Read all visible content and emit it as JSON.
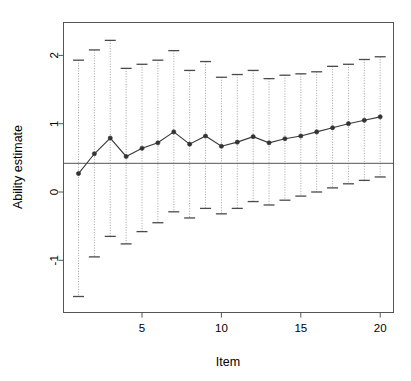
{
  "chart_data": {
    "type": "line",
    "title": "",
    "xlabel": "Item",
    "ylabel": "Ability estimate",
    "xlim": [
      0.5,
      20.5
    ],
    "ylim": [
      -1.75,
      2.45
    ],
    "grid": false,
    "legend": null,
    "xticks": [
      5,
      10,
      15,
      20
    ],
    "xtick_labels": [
      "5",
      "10",
      "15",
      "20"
    ],
    "yticks": [
      -1,
      0,
      1,
      2
    ],
    "ytick_labels": [
      "-1",
      "0",
      "1",
      "2"
    ],
    "reference_line": {
      "orientation": "horizontal",
      "value": 0.42,
      "label": ""
    },
    "series": [
      {
        "name": "Ability estimate",
        "marker": "filled-circle",
        "color": "#3a3a3a",
        "x": [
          1,
          2,
          3,
          4,
          5,
          6,
          7,
          8,
          9,
          10,
          11,
          12,
          13,
          14,
          15,
          16,
          17,
          18,
          19,
          20
        ],
        "values": [
          0.27,
          0.56,
          0.79,
          0.52,
          0.64,
          0.72,
          0.88,
          0.7,
          0.82,
          0.67,
          0.73,
          0.81,
          0.72,
          0.78,
          0.82,
          0.88,
          0.94,
          1.0,
          1.05,
          1.1
        ],
        "error_upper": [
          1.93,
          2.08,
          2.22,
          1.81,
          1.87,
          1.93,
          2.07,
          1.78,
          1.91,
          1.68,
          1.72,
          1.78,
          1.66,
          1.71,
          1.73,
          1.76,
          1.84,
          1.87,
          1.94,
          1.98
        ],
        "error_lower": [
          -1.53,
          -0.95,
          -0.65,
          -0.76,
          -0.58,
          -0.45,
          -0.29,
          -0.38,
          -0.24,
          -0.32,
          -0.24,
          -0.14,
          -0.19,
          -0.12,
          -0.06,
          0.0,
          0.06,
          0.12,
          0.17,
          0.22
        ]
      }
    ],
    "colors": {
      "line": "#3a3a3a",
      "marker": "#333333",
      "errorbar": "#999999",
      "reference_line": "#555555",
      "frame": "#555555",
      "background": "#ffffff"
    }
  },
  "axes": {
    "y_label": "Ability estimate",
    "x_label": "Item"
  }
}
